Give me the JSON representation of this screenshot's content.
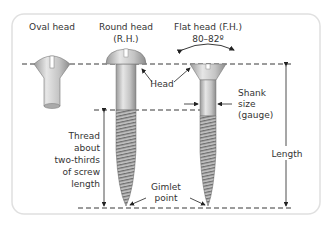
{
  "diagram": {
    "labels": {
      "oval_head": "Oval head",
      "round_head": "Round head",
      "round_head_abbr": "(R.H.)",
      "flat_head": "Flat head (F.H.)",
      "flat_angle": "80–82º",
      "head": "Head",
      "shank_1": "Shank",
      "shank_2": "size",
      "shank_3": "(gauge)",
      "length": "Length",
      "thread_1": "Thread",
      "thread_2": "about",
      "thread_3": "two-thirds",
      "thread_4": "of screw",
      "thread_5": "length",
      "gimlet_1": "Gimlet",
      "gimlet_2": "point"
    },
    "colors": {
      "panel_border": "#dddddd",
      "screw_fill": "#c8c8c8",
      "screw_dark": "#8a8a8a",
      "line": "#222222",
      "text": "#333333"
    }
  }
}
